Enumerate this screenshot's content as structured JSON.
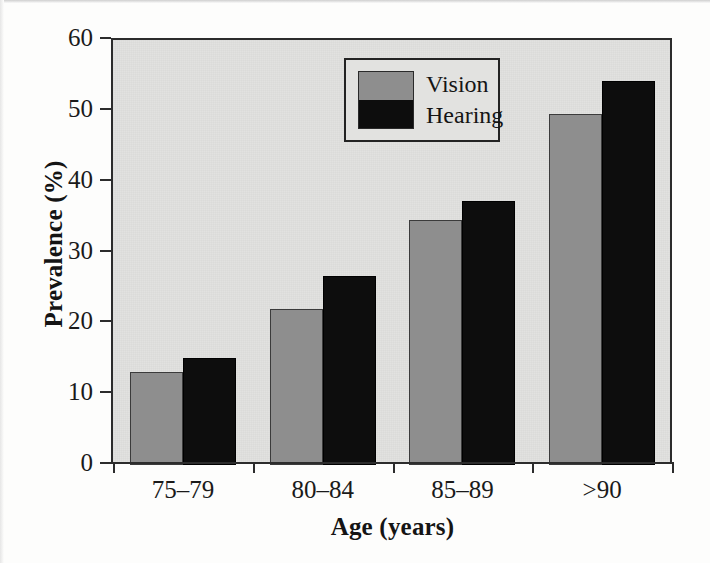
{
  "chart_data": {
    "type": "bar",
    "title": "",
    "xlabel": "Age (years)",
    "ylabel": "Prevalence (%)",
    "categories": [
      "75–79",
      "80–84",
      "85–89",
      ">90"
    ],
    "series": [
      {
        "name": "Vision",
        "color": "#8e8e8e",
        "values": [
          13.2,
          22.0,
          34.6,
          49.5
        ]
      },
      {
        "name": "Hearing",
        "color": "#0d0d0d",
        "values": [
          15.1,
          26.7,
          37.3,
          54.2
        ]
      }
    ],
    "ylim": [
      0,
      60
    ],
    "yticks": [
      0,
      10,
      20,
      30,
      40,
      50,
      60
    ],
    "ytick_labels": [
      "0",
      "10",
      "20",
      "30",
      "40",
      "50",
      "60"
    ],
    "grid": false,
    "legend_position": "top-center",
    "plot_background": "#e2e2e0",
    "axis_color": "#2c2c2c"
  },
  "legend": {
    "items": [
      {
        "label": "Vision",
        "color": "#8e8e8e"
      },
      {
        "label": "Hearing",
        "color": "#0d0d0d"
      }
    ]
  }
}
